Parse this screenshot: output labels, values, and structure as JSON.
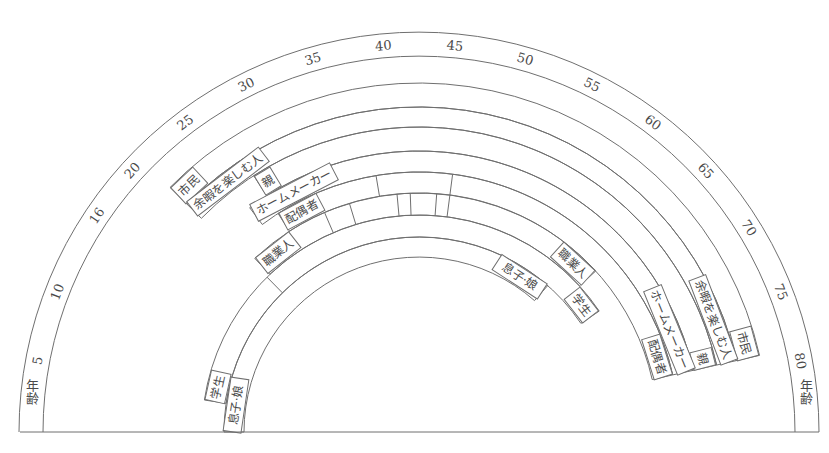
{
  "chart_data": {
    "type": "diagram",
    "title": "",
    "age_axis": {
      "label": "年齢",
      "ticks": [
        {
          "age": 5,
          "label": "5"
        },
        {
          "age": 10,
          "label": "10"
        },
        {
          "age": 16,
          "label": "16"
        },
        {
          "age": 20,
          "label": "20"
        },
        {
          "age": 25,
          "label": "25"
        },
        {
          "age": 30,
          "label": "30"
        },
        {
          "age": 35,
          "label": "35"
        },
        {
          "age": 40,
          "label": "40"
        },
        {
          "age": 45,
          "label": "45"
        },
        {
          "age": 50,
          "label": "50"
        },
        {
          "age": 55,
          "label": "55"
        },
        {
          "age": 60,
          "label": "60"
        },
        {
          "age": 65,
          "label": "65"
        },
        {
          "age": 70,
          "label": "70"
        },
        {
          "age": 75,
          "label": "75"
        },
        {
          "age": 80,
          "label": "80"
        }
      ],
      "end_label_left": "年齢",
      "end_label_right": "年齢"
    },
    "roles": [
      {
        "name": "市民",
        "start_age": 21,
        "end_age": 79,
        "start_label": "市民",
        "end_label": "市民",
        "dividers": []
      },
      {
        "name": "余暇を楽しむ人",
        "start_age": 21,
        "end_age": 79,
        "start_label": "余暇を楽しむ人",
        "end_label": "余暇を楽しむ人",
        "dividers": []
      },
      {
        "name": "親",
        "start_age": 27,
        "end_age": 79,
        "start_label": "親",
        "end_label": "親",
        "dividers": []
      },
      {
        "name": "ホームメーカー",
        "start_age": 25,
        "end_age": 79,
        "start_label": "ホームメーカー",
        "end_label": "ホームメーカー",
        "dividers": []
      },
      {
        "name": "配偶者",
        "start_age": 27,
        "end_age": 79,
        "start_label": "配偶者",
        "end_label": "配偶者",
        "dividers": [
          38,
          46
        ]
      },
      {
        "name": "職業人",
        "start_age": 22,
        "end_age": 65,
        "start_label": "職業人",
        "end_label": "職業人",
        "dividers": [
          31.5,
          34.5,
          40,
          41.5,
          44.5,
          46
        ]
      },
      {
        "name": "学生",
        "start_age": 4,
        "end_age": 69,
        "start_label": "学生",
        "end_label": "学生",
        "dividers": [
          21.5
        ]
      },
      {
        "name": "息子・娘",
        "start_age": 0,
        "end_age": 62,
        "start_label": "息子·娘",
        "end_label": "息子·娘",
        "dividers": []
      }
    ]
  },
  "geometry": {
    "cx": 419,
    "cy": 432,
    "age_ring": {
      "outer": 400,
      "inner": 376
    },
    "band_radii": [
      349,
      325,
      305,
      281,
      260,
      239,
      217,
      195,
      175
    ],
    "deg_per_year": 2.118,
    "baseline": {
      "x1": 20,
      "x2": 819
    }
  }
}
